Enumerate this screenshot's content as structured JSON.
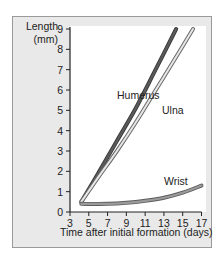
{
  "chart_data": {
    "type": "line",
    "title": "",
    "xlabel": "Time after initial formation (days)",
    "ylabel": "Length (mm)",
    "xlim": [
      3,
      17
    ],
    "ylim": [
      0,
      9
    ],
    "x_ticks": [
      3,
      5,
      7,
      9,
      11,
      13,
      15,
      17
    ],
    "y_ticks": [
      0,
      1,
      2,
      3,
      4,
      5,
      6,
      7,
      8,
      9
    ],
    "grid": false,
    "legend": "inline labels",
    "series": [
      {
        "name": "Humerus",
        "color": "#555555",
        "x": [
          4.2,
          6,
          8,
          10,
          12,
          14.3
        ],
        "y": [
          0.5,
          1.9,
          3.5,
          5.1,
          6.9,
          9.0
        ]
      },
      {
        "name": "Ulna",
        "color": "#bdbdbd",
        "x": [
          4.2,
          6,
          8,
          10,
          12,
          14,
          16.1
        ],
        "y": [
          0.5,
          1.7,
          3.0,
          4.4,
          5.9,
          7.4,
          9.0
        ]
      },
      {
        "name": "Wrist",
        "color": "#808080",
        "x": [
          4.2,
          7,
          9,
          11,
          13,
          15,
          17
        ],
        "y": [
          0.4,
          0.4,
          0.45,
          0.55,
          0.7,
          0.95,
          1.3
        ]
      }
    ],
    "annotations": [
      {
        "text": "Humerus",
        "x": 9.5,
        "y": 5.8
      },
      {
        "text": "Ulna",
        "x": 13.2,
        "y": 5.0
      },
      {
        "text": "Wrist",
        "x": 14.5,
        "y": 1.6
      }
    ]
  },
  "labels": {
    "ylabel_line1": "Length",
    "ylabel_line2": "(mm)",
    "xlabel": "Time after initial formation (days)",
    "humerus": "Humerus",
    "ulna": "Ulna",
    "wrist": "Wrist"
  }
}
